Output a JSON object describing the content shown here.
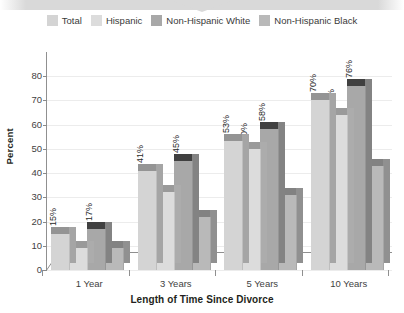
{
  "banner": {
    "shape": "chevron-notch",
    "color": "#d9d9d9"
  },
  "legend": {
    "position": "top-center",
    "items": [
      {
        "label": "Total",
        "color": "#d4d4d4"
      },
      {
        "label": "Hispanic",
        "color": "#dcdcdc"
      },
      {
        "label": "Non-Hispanic White",
        "color": "#a8a8a8"
      },
      {
        "label": "Non-Hispanic Black",
        "color": "#b9b9b9"
      }
    ]
  },
  "axes": {
    "ylabel": "Percent",
    "xlabel": "Length of Time Since Divorce",
    "yticks": [
      "0",
      "10",
      "20",
      "30",
      "40",
      "50",
      "60",
      "70",
      "80"
    ],
    "xticks": [
      "1 Year",
      "3 Years",
      "5 Years",
      "10 Years"
    ]
  },
  "chart_data": {
    "type": "bar",
    "title": "",
    "subtitle": "",
    "xlabel": "Length of Time Since Divorce",
    "ylabel": "Percent",
    "ylim": [
      0,
      80
    ],
    "ytick_step": 10,
    "grid": true,
    "legend_position": "top-center",
    "style": "3d-clustered-column",
    "categories": [
      "1 Year",
      "3 Years",
      "5 Years",
      "10 Years"
    ],
    "series": [
      {
        "name": "Total",
        "color": "#d4d4d4",
        "values": [
          15,
          41,
          53,
          70
        ],
        "labels": [
          "15%",
          "41%",
          "53%",
          "70%"
        ]
      },
      {
        "name": "Hispanic",
        "color": "#dcdcdc",
        "values": [
          9,
          32,
          50,
          64
        ],
        "labels": [
          "9%",
          "32%",
          "50%",
          "64%"
        ]
      },
      {
        "name": "Non-Hispanic White",
        "color": "#a8a8a8",
        "values": [
          17,
          45,
          58,
          76
        ],
        "labels": [
          "17%",
          "45%",
          "58%",
          "76%"
        ]
      },
      {
        "name": "Non-Hispanic Black",
        "color": "#b9b9b9",
        "values": [
          9,
          22,
          31,
          43
        ],
        "labels": [
          "9%",
          "22%",
          "31%",
          "43%"
        ]
      }
    ]
  }
}
